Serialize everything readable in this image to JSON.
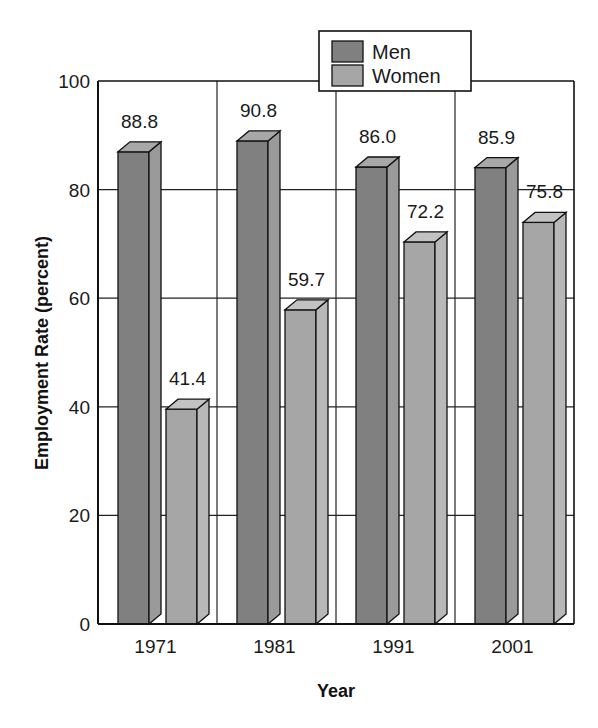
{
  "chart_data": {
    "type": "bar",
    "title": "",
    "xlabel": "Year",
    "ylabel": "Employment Rate (percent)",
    "categories": [
      "1971",
      "1981",
      "1991",
      "2001"
    ],
    "series": [
      {
        "name": "Men",
        "values": [
          88.8,
          90.8,
          86.0,
          85.9
        ],
        "color": "#808080"
      },
      {
        "name": "Women",
        "values": [
          41.4,
          59.7,
          72.2,
          75.8
        ],
        "color": "#a6a6a6"
      }
    ],
    "value_labels": {
      "Men": [
        "88.8",
        "90.8",
        "86.0",
        "85.9"
      ],
      "Women": [
        "41.4",
        "59.7",
        "72.2",
        "75.8"
      ]
    },
    "ylim": [
      0,
      100
    ],
    "yticks": [
      0,
      20,
      40,
      60,
      80,
      100
    ],
    "grid": true,
    "style": "3d-bars",
    "legend": {
      "position": "top-center",
      "entries": [
        "Men",
        "Women"
      ]
    }
  }
}
